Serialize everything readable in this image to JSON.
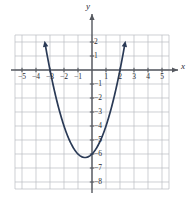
{
  "figure": {
    "kind": "cartesian-plane-graph",
    "axis_labels": {
      "x": "x",
      "y": "y"
    },
    "colors": {
      "background": "#ffffff",
      "grid": "#b9bcc2",
      "axis": "#55585f",
      "curve": "#2a3a56",
      "text": "#2b2b33"
    }
  },
  "chart_data": {
    "type": "line",
    "title": "",
    "xlabel": "x",
    "ylabel": "y",
    "grid": true,
    "legend": "none",
    "xlim": [
      -5.5,
      5.5
    ],
    "ylim": [
      -8.5,
      2.5
    ],
    "xticks": [
      -5,
      -4,
      -3,
      -2,
      -1,
      1,
      2,
      3,
      4,
      5
    ],
    "yticks": [
      2,
      1,
      -1,
      -2,
      -3,
      -4,
      -5,
      -6,
      -7,
      -8
    ],
    "xtick_labels": [
      "−5",
      "−4",
      "−3",
      "−2",
      "−1",
      "1",
      "2",
      "3",
      "4",
      "5"
    ],
    "ytick_labels": [
      "2",
      "1",
      "−1",
      "−2",
      "−3",
      "−4",
      "−5",
      "−6",
      "−7",
      "−8"
    ],
    "series": [
      {
        "name": "parabola",
        "equation": "y = x^2 + x - 6",
        "vertex": [
          -0.5,
          -6.25
        ],
        "roots": [
          -3,
          2
        ],
        "y_intercept": -6,
        "opens": "up",
        "arrowheads": [
          "start",
          "end"
        ],
        "x": [
          -3.35,
          -3.0,
          -2.5,
          -2.0,
          -1.5,
          -1.0,
          -0.5,
          0.0,
          0.5,
          1.0,
          1.5,
          2.0,
          2.35
        ],
        "values": [
          -1.13,
          0.0,
          -2.25,
          -4.0,
          -5.25,
          -6.0,
          -6.25,
          -6.0,
          -5.25,
          -4.0,
          -2.25,
          0.0,
          1.87
        ]
      }
    ]
  }
}
